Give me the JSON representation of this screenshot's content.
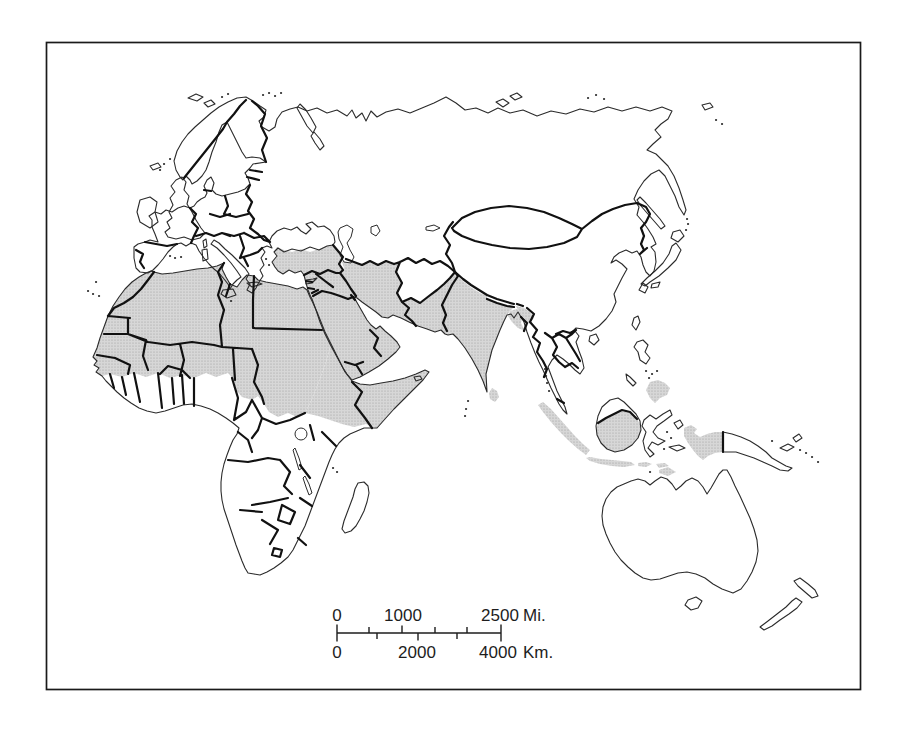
{
  "figure": {
    "kind": "printed book map figure",
    "background": "#ffffff",
    "frame_color": "#1a1a1a"
  },
  "colors": {
    "shade_base": "#d7d7d7",
    "shade_dot": "#9c9c9c",
    "coastline": "#2b2b2b",
    "border": "#111111",
    "scale_text": "#1d1d1d"
  },
  "scale_bar": {
    "miles": {
      "tick_labels": [
        "0",
        "1000",
        "2500"
      ],
      "unit": "Mi."
    },
    "kilometers": {
      "tick_labels": [
        "0",
        "2000",
        "4000"
      ],
      "unit": "Km."
    }
  },
  "map": {
    "shaded_regions": [
      "North Africa and Sahel belt",
      "Horn of Africa",
      "Arabian Peninsula",
      "Turkey",
      "Syria-Iraq-Iran-Afghanistan-Pakistan block",
      "India",
      "Bangladesh",
      "Sri Lanka",
      "Sumatra",
      "Java",
      "Kalimantan (southern Borneo)",
      "Lesser Sunda Islands",
      "Timor",
      "Western New Guinea",
      "Mindanao"
    ],
    "unshaded_landmasses": [
      "Europe",
      "Sub-Saharan Africa",
      "Madagascar",
      "USSR/Central Asia",
      "China",
      "Mongolia",
      "Korea",
      "Japan",
      "Indochina",
      "Malay Peninsula",
      "Sulawesi",
      "Luzon",
      "Eastern New Guinea",
      "Australia",
      "New Zealand"
    ]
  }
}
